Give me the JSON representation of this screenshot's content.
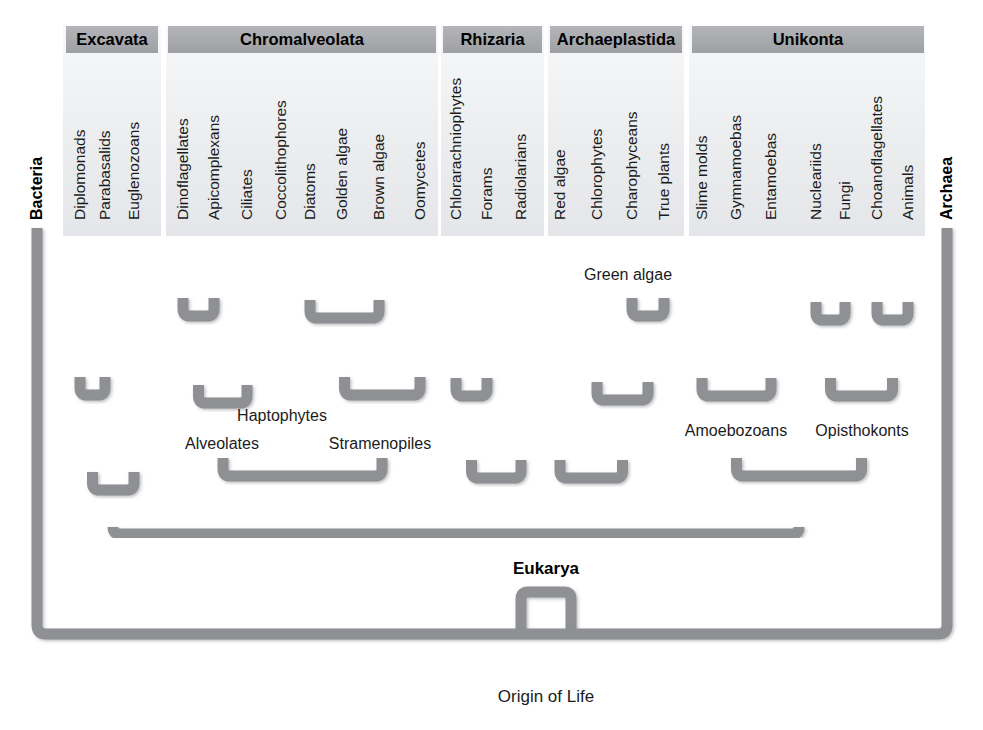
{
  "figure": {
    "type": "phylogenetic-tree",
    "title_domain_labels": {
      "bacteria": "Bacteria",
      "archaea": "Archaea",
      "eukarya": "Eukarya",
      "origin": "Origin of Life"
    },
    "colors": {
      "branch": "#8e9094",
      "branch_edge": "#7a7c80",
      "header_bar": "#a9aaad",
      "panel_bg": "#eceef0",
      "text": "#1b1b1b",
      "background": "#ffffff"
    }
  },
  "supergroups": [
    {
      "id": "excavata",
      "label": "Excavata",
      "panel": {
        "x": 63,
        "width": 98
      },
      "header": {
        "x": 66,
        "width": 92
      },
      "taxa": [
        {
          "label": "Diplomonads",
          "x": 80
        },
        {
          "label": "Parabasalids",
          "x": 105
        },
        {
          "label": "Euglenozoans",
          "x": 134
        }
      ],
      "clades": []
    },
    {
      "id": "chromalveolata",
      "label": "Chromalveolata",
      "panel": {
        "x": 166,
        "width": 272
      },
      "header": {
        "x": 168,
        "width": 268
      },
      "taxa": [
        {
          "label": "Dinoflagellates",
          "x": 183
        },
        {
          "label": "Apicomplexans",
          "x": 214
        },
        {
          "label": "Ciliates",
          "x": 247
        },
        {
          "label": "Coccolithophores",
          "x": 281
        },
        {
          "label": "Diatoms",
          "x": 310
        },
        {
          "label": "Golden algae",
          "x": 342
        },
        {
          "label": "Brown algae",
          "x": 379
        },
        {
          "label": "Oomycetes",
          "x": 420
        }
      ],
      "clades": [
        {
          "label": "Alveolates",
          "x": 222,
          "y": 449
        },
        {
          "label": "Haptophytes",
          "x": 282,
          "y": 421
        },
        {
          "label": "Stramenopiles",
          "x": 380,
          "y": 449
        }
      ]
    },
    {
      "id": "rhizaria",
      "label": "Rhizaria",
      "panel": {
        "x": 441,
        "width": 103
      },
      "header": {
        "x": 443,
        "width": 99
      },
      "taxa": [
        {
          "label": "Chlorarachniophytes",
          "x": 456
        },
        {
          "label": "Forams",
          "x": 487
        },
        {
          "label": "Radiolarians",
          "x": 521
        }
      ],
      "clades": []
    },
    {
      "id": "archaeplastida",
      "label": "Archaeplastida",
      "panel": {
        "x": 548,
        "width": 136
      },
      "header": {
        "x": 550,
        "width": 132
      },
      "taxa": [
        {
          "label": "Red algae",
          "x": 560
        },
        {
          "label": "Chlorophytes",
          "x": 597
        },
        {
          "label": "Charophyceans",
          "x": 632
        },
        {
          "label": "True plants",
          "x": 664
        }
      ],
      "clades": [
        {
          "label": "Green algae",
          "x": 628,
          "y": 280
        }
      ]
    },
    {
      "id": "unikonta",
      "label": "Unikonta",
      "panel": {
        "x": 689,
        "width": 236
      },
      "header": {
        "x": 692,
        "width": 232
      },
      "taxa": [
        {
          "label": "Slime molds",
          "x": 702
        },
        {
          "label": "Gymnamoebas",
          "x": 736
        },
        {
          "label": "Entamoebas",
          "x": 771
        },
        {
          "label": "Nucleariids",
          "x": 816
        },
        {
          "label": "Fungi",
          "x": 845
        },
        {
          "label": "Choanoflagellates",
          "x": 877
        },
        {
          "label": "Animals",
          "x": 908
        }
      ],
      "clades": [
        {
          "label": "Amoebozoans",
          "x": 736,
          "y": 436
        },
        {
          "label": "Opisthokonts",
          "x": 862,
          "y": 436
        }
      ]
    }
  ],
  "domains": {
    "bacteria": {
      "label": "Bacteria",
      "x": 37,
      "tip_y": 228
    },
    "archaea": {
      "label": "Archaea",
      "x": 947,
      "tip_y": 228
    }
  },
  "geometry": {
    "tip_y": 228,
    "header_y": 26,
    "header_height": 27,
    "panel_bottom": 236,
    "eukarya_trunk_y": 534,
    "eukarya_node_y": 592,
    "base_bar_y": 634,
    "origin_stem_bottom": 684,
    "center_x": 546,
    "branch_width": 11
  },
  "chart_data": {
    "type": "tree",
    "root": "Origin of Life",
    "domains": [
      "Bacteria",
      "Archaea",
      "Eukarya"
    ],
    "eukaryote_supergroups": [
      "Excavata",
      "Chromalveolata",
      "Rhizaria",
      "Archaeplastida",
      "Unikonta"
    ],
    "nodes": [
      {
        "clade": "Excavata",
        "children": [
          "Diplomonads",
          "Parabasalids",
          "Euglenozoans"
        ],
        "topology": "((Diplomonads,Parabasalids),Euglenozoans)"
      },
      {
        "clade": "Alveolates",
        "children": [
          "Dinoflagellates",
          "Apicomplexans",
          "Ciliates"
        ],
        "topology": "((Dinoflagellates,Apicomplexans),Ciliates)"
      },
      {
        "clade": "Haptophytes",
        "children": [
          "Coccolithophores"
        ],
        "topology": "(Coccolithophores)"
      },
      {
        "clade": "Stramenopiles",
        "children": [
          "Diatoms",
          "Golden algae",
          "Brown algae",
          "Oomycetes"
        ],
        "topology": "((Diatoms,Golden algae,Brown algae),Oomycetes)"
      },
      {
        "clade": "Chromalveolata",
        "children": [
          "Alveolates",
          "Haptophytes",
          "Stramenopiles"
        ],
        "topology": "(Alveolates,Haptophytes,Stramenopiles)"
      },
      {
        "clade": "Rhizaria",
        "children": [
          "Chlorarachniophytes",
          "Forams",
          "Radiolarians"
        ],
        "topology": "((Chlorarachniophytes,Forams),Radiolarians)"
      },
      {
        "clade": "Green algae",
        "children": [
          "Chlorophytes",
          "Charophyceans"
        ],
        "topology": "(Chlorophytes,(Charophyceans,True plants))"
      },
      {
        "clade": "Archaeplastida",
        "children": [
          "Red algae",
          "Chlorophytes",
          "Charophyceans",
          "True plants"
        ],
        "topology": "(Red algae,(Chlorophytes,(Charophyceans,True plants)))"
      },
      {
        "clade": "Amoebozoans",
        "children": [
          "Slime molds",
          "Gymnamoebas",
          "Entamoebas"
        ],
        "topology": "(Slime molds,Gymnamoebas,Entamoebas)"
      },
      {
        "clade": "Opisthokonts",
        "children": [
          "Nucleariids",
          "Fungi",
          "Choanoflagellates",
          "Animals"
        ],
        "topology": "((Nucleariids,Fungi),(Choanoflagellates,Animals))"
      },
      {
        "clade": "Unikonta",
        "children": [
          "Amoebozoans",
          "Opisthokonts"
        ],
        "topology": "(Amoebozoans,Opisthokonts)"
      }
    ],
    "leaf_count": 25,
    "xlabel": "",
    "ylabel": "",
    "legend": "none",
    "grid": false
  }
}
